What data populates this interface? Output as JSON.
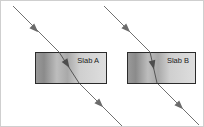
{
  "figure": {
    "width": 204,
    "height": 127,
    "background_color": "#ffffff",
    "border_color": "#cfcfcf"
  },
  "slabs": [
    {
      "id": "slab-a",
      "label": "Slab A",
      "x": 34,
      "y": 51,
      "width": 71,
      "height": 31,
      "border_color": "#2b2b2b",
      "fill_left_color": "#8e8e8e",
      "fill_mid_color": "#c9c9c9",
      "fill_right_color": "#d8d8d8",
      "label_x": 98,
      "label_y": 62,
      "label_anchor": "end"
    },
    {
      "id": "slab-b",
      "label": "Slab B",
      "x": 126,
      "y": 51,
      "width": 68,
      "height": 31,
      "border_color": "#2b2b2b",
      "fill_left_color": "#8e8e8e",
      "fill_mid_color": "#c9c9c9",
      "fill_right_color": "#d8d8d8",
      "label_x": 188,
      "label_y": 62,
      "label_anchor": "end"
    }
  ],
  "rays": [
    {
      "id": "ray-a",
      "slab": "Slab A",
      "color": "#707070",
      "stroke_width": 1,
      "incident_segment": {
        "x1": 12,
        "y1": 5,
        "x2": 58,
        "y2": 51
      },
      "internal_segment": {
        "x1": 58,
        "y1": 51,
        "x2": 78,
        "y2": 82
      },
      "emergent_segment": {
        "x1": 78,
        "y1": 82,
        "x2": 122,
        "y2": 126
      },
      "arrowheads": [
        {
          "x": 34,
          "y": 28,
          "angle": 45
        },
        {
          "x": 66,
          "y": 63,
          "angle": 57
        },
        {
          "x": 99,
          "y": 103,
          "angle": 45
        }
      ]
    },
    {
      "id": "ray-b",
      "slab": "Slab B",
      "color": "#707070",
      "stroke_width": 1,
      "incident_segment": {
        "x1": 103,
        "y1": 5,
        "x2": 149,
        "y2": 51
      },
      "internal_segment": {
        "x1": 149,
        "y1": 51,
        "x2": 156,
        "y2": 82
      },
      "emergent_segment": {
        "x1": 156,
        "y1": 82,
        "x2": 198,
        "y2": 124
      },
      "arrowheads": [
        {
          "x": 126,
          "y": 28,
          "angle": 45
        },
        {
          "x": 152,
          "y": 64,
          "angle": 77
        },
        {
          "x": 179,
          "y": 105,
          "angle": 45
        }
      ]
    }
  ]
}
